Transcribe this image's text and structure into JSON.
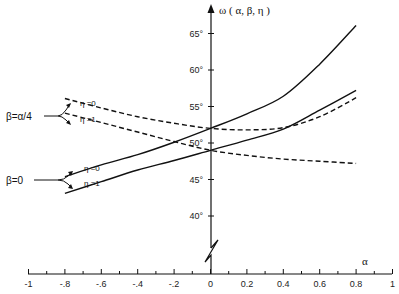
{
  "chart_data": {
    "type": "line",
    "title": "",
    "xlabel": "α",
    "ylabel": "ω ( α, β, η )",
    "xlim": [
      -1,
      1
    ],
    "ylim": [
      37,
      67
    ],
    "grid": false,
    "legend_position": "left-annotations",
    "x_ticks": [
      -1,
      -0.8,
      -0.6,
      -0.4,
      -0.2,
      0,
      0.2,
      0.4,
      0.6,
      0.8,
      1
    ],
    "x_tick_labels": [
      "-1",
      "-.8",
      "-.6",
      "-.4",
      "-.2",
      "0",
      "0.2",
      "0.4",
      "0.6",
      "0.8",
      "1"
    ],
    "y_ticks": [
      40,
      45,
      50,
      55,
      60,
      65
    ],
    "y_tick_labels": [
      "40°",
      "45°",
      "50°",
      "55°",
      "60°",
      "65°"
    ],
    "y_axis_break": true,
    "x": [
      -0.8,
      -0.6,
      -0.4,
      -0.2,
      0,
      0.2,
      0.4,
      0.6,
      0.8
    ],
    "series": [
      {
        "name": "β=0, η=0",
        "style": "solid",
        "values": [
          45.4,
          47.0,
          48.4,
          50.1,
          52.0,
          54.0,
          56.4,
          60.8,
          66.1
        ]
      },
      {
        "name": "β=0, η=1",
        "style": "solid",
        "values": [
          43.1,
          44.7,
          46.3,
          47.6,
          49.0,
          50.4,
          51.9,
          54.5,
          57.2
        ]
      },
      {
        "name": "β=α/4, η=0",
        "style": "dashed",
        "values": [
          56.1,
          54.8,
          53.6,
          52.7,
          52.0,
          51.8,
          52.1,
          53.6,
          56.2
        ]
      },
      {
        "name": "β=α/4, η=1",
        "style": "dashed",
        "values": [
          54.1,
          52.8,
          51.5,
          50.2,
          49.0,
          48.3,
          47.8,
          47.5,
          47.2
        ]
      }
    ],
    "annotations": [
      {
        "text": "β=α/4",
        "targets": [
          "η=0",
          "η=1"
        ]
      },
      {
        "text": "β=0",
        "targets": [
          "η=0",
          "η=1"
        ]
      }
    ]
  },
  "labels": {
    "y_axis_title": "ω ( α, β, η )",
    "x_axis_title": "α",
    "group_beta_alpha4": "β=α/4",
    "group_beta_zero": "β=0",
    "eta0": "η =0",
    "eta1": "η =1"
  }
}
